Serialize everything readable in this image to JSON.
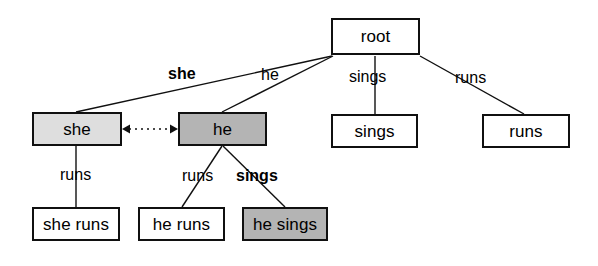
{
  "diagram": {
    "type": "word-lattice-tree",
    "colors": {
      "stroke": "#101010",
      "node_fill_default": "#ffffff",
      "node_fill_light": "#dedede",
      "node_fill_medium": "#b4b4b4",
      "text": "#000000"
    },
    "nodes": [
      {
        "id": "root",
        "label": "root",
        "fill": "default",
        "x": 331,
        "y": 18,
        "w": 89,
        "h": 37
      },
      {
        "id": "she",
        "label": "she",
        "fill": "light",
        "x": 32,
        "y": 112,
        "w": 90,
        "h": 34
      },
      {
        "id": "he",
        "label": "he",
        "fill": "medium",
        "x": 178,
        "y": 112,
        "w": 89,
        "h": 34
      },
      {
        "id": "sings",
        "label": "sings",
        "fill": "default",
        "x": 331,
        "y": 114,
        "w": 87,
        "h": 34
      },
      {
        "id": "runs",
        "label": "runs",
        "fill": "default",
        "x": 482,
        "y": 114,
        "w": 88,
        "h": 34
      },
      {
        "id": "she_runs",
        "label": "she runs",
        "fill": "default",
        "x": 32,
        "y": 207,
        "w": 88,
        "h": 34
      },
      {
        "id": "he_runs",
        "label": "he runs",
        "fill": "default",
        "x": 138,
        "y": 207,
        "w": 87,
        "h": 34
      },
      {
        "id": "he_sings",
        "label": "he sings",
        "fill": "medium",
        "x": 242,
        "y": 207,
        "w": 86,
        "h": 34
      }
    ],
    "edges": [
      {
        "from": "root",
        "to": "she",
        "label": "she",
        "bold": true,
        "x1": 332,
        "y1": 56,
        "x2": 76,
        "y2": 112,
        "label_x": 168,
        "label_y": 66
      },
      {
        "from": "root",
        "to": "he",
        "label": "he",
        "bold": false,
        "x1": 333,
        "y1": 56,
        "x2": 222,
        "y2": 112,
        "label_x": 261,
        "label_y": 67
      },
      {
        "from": "root",
        "to": "sings",
        "label": "sings",
        "bold": false,
        "x1": 375,
        "y1": 56,
        "x2": 375,
        "y2": 114,
        "label_x": 349,
        "label_y": 69
      },
      {
        "from": "root",
        "to": "runs",
        "label": "runs",
        "bold": false,
        "x1": 420,
        "y1": 56,
        "x2": 524,
        "y2": 114,
        "label_x": 455,
        "label_y": 70
      },
      {
        "from": "she",
        "to": "she_runs",
        "label": "runs",
        "bold": false,
        "x1": 76,
        "y1": 146,
        "x2": 76,
        "y2": 207,
        "label_x": 60,
        "label_y": 167
      },
      {
        "from": "he",
        "to": "he_runs",
        "label": "runs",
        "bold": false,
        "x1": 222,
        "y1": 146,
        "x2": 182,
        "y2": 207,
        "label_x": 182,
        "label_y": 168
      },
      {
        "from": "he",
        "to": "he_sings",
        "label": "sings",
        "bold": true,
        "x1": 223,
        "y1": 146,
        "x2": 285,
        "y2": 207,
        "label_x": 236,
        "label_y": 168
      }
    ],
    "link": {
      "from": "he",
      "to": "she",
      "style": "dotted-double-arrow",
      "x1": 122,
      "x2": 178,
      "y": 129
    }
  }
}
